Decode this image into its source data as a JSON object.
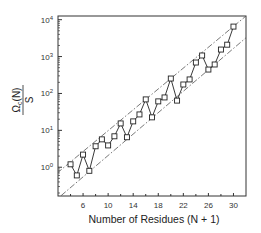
{
  "chart_data": {
    "type": "line",
    "title": "",
    "xlabel": "Number of Residues (N + 1)",
    "ylabel": {
      "numerator": "Ω",
      "subscript": "c",
      "numerator_suffix": "(N)",
      "denominator": "S"
    },
    "xlim": [
      2,
      32
    ],
    "ylim_log10": [
      -0.78,
      4.1
    ],
    "yscale": "log",
    "x_ticks": [
      6,
      10,
      14,
      18,
      22,
      26,
      30
    ],
    "x_tick_labels": [
      "6",
      "10",
      "14",
      "18",
      "22",
      "26",
      "30"
    ],
    "x_minor_ticks": [
      4,
      8,
      12,
      16,
      20,
      24,
      28
    ],
    "y_ticks": [
      {
        "exp": 0,
        "label_base": "10",
        "label_exp": "0"
      },
      {
        "exp": 1,
        "label_base": "10",
        "label_exp": "1"
      },
      {
        "exp": 2,
        "label_base": "10",
        "label_exp": "2"
      },
      {
        "exp": 3,
        "label_base": "10",
        "label_exp": "3"
      },
      {
        "exp": 4,
        "label_base": "10",
        "label_exp": "4"
      }
    ],
    "grid": false,
    "series": [
      {
        "name": "data",
        "marker": "open-square",
        "line": "solid",
        "x": [
          4,
          5,
          6,
          7,
          8,
          9,
          10,
          11,
          12,
          13,
          14,
          15,
          16,
          17,
          18,
          19,
          20,
          21,
          22,
          23,
          24,
          25,
          26,
          27,
          28,
          29,
          30
        ],
        "y": [
          1.2,
          0.6,
          2.2,
          0.8,
          3.7,
          5.7,
          3.9,
          6.9,
          15.4,
          6.5,
          17.5,
          27,
          69,
          22.5,
          61,
          78,
          254,
          64,
          175,
          240,
          690,
          1070,
          445,
          610,
          1550,
          2100,
          6500
        ]
      }
    ],
    "reference_lines": [
      {
        "name": "upper-bound",
        "style": "dash-dot",
        "x": [
          1.84,
          32
        ],
        "y": [
          0.69,
          12600
        ]
      },
      {
        "name": "lower-bound",
        "style": "dash-dot",
        "x": [
          2.5,
          32
        ],
        "y": [
          0.17,
          3240
        ]
      }
    ]
  }
}
